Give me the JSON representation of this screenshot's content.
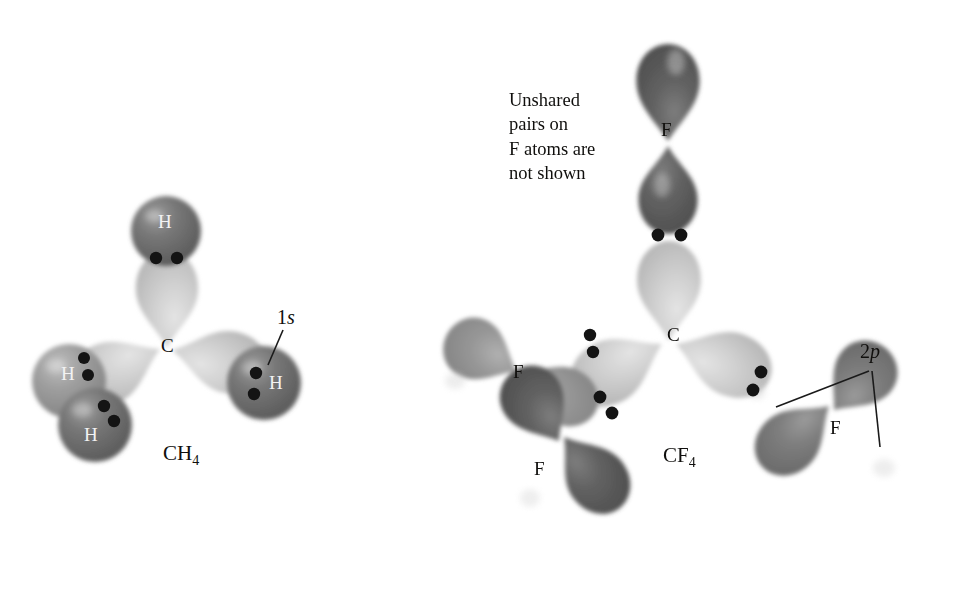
{
  "figure": {
    "background": "#ffffff",
    "width": 972,
    "height": 606
  },
  "annotation": {
    "note_text": "Unshared\npairs on\nF atoms are\nnot shown"
  },
  "colors": {
    "carbon_lobe": "#c9c9c9",
    "carbon_lobe_edge": "#b0b0b0",
    "hydrogen_sphere_front": "#6e6e6e",
    "hydrogen_sphere_back": "#9a9a9a",
    "fluorine_lobe_dark": "#5d5d5d",
    "fluorine_lobe_mid": "#7c7c7c",
    "fluorine_lobe_light": "#949494",
    "electron_dot": "#141414",
    "text": "#100f0d",
    "text_on_orbital": "#f2f2f2",
    "leader_line": "#1a1a1a"
  },
  "molecules": [
    {
      "id": "ch4",
      "formula_main": "CH",
      "formula_sub": "4",
      "formula_label": "CH4",
      "center_atom": "C",
      "orbital_callout": {
        "prefix": "1",
        "italic": "s",
        "label": "1s",
        "description": "hydrogen 1s orbital"
      },
      "atoms": [
        {
          "symbol": "H",
          "position": "top",
          "label_color": "white"
        },
        {
          "symbol": "H",
          "position": "lower-left-back",
          "label_color": "white"
        },
        {
          "symbol": "H",
          "position": "lower-left-front",
          "label_color": "white"
        },
        {
          "symbol": "H",
          "position": "right",
          "label_color": "white"
        },
        {
          "symbol": "C",
          "position": "center",
          "label_color": "black"
        }
      ],
      "bond_pairs": 4,
      "electron_dots_per_bond": 2
    },
    {
      "id": "cf4",
      "formula_main": "CF",
      "formula_sub": "4",
      "formula_label": "CF4",
      "center_atom": "C",
      "orbital_callout": {
        "prefix": "2",
        "italic": "p",
        "label": "2p",
        "description": "fluorine 2p orbital",
        "leader_count": 2
      },
      "atoms": [
        {
          "symbol": "F",
          "position": "top",
          "label_color": "black"
        },
        {
          "symbol": "F",
          "position": "left",
          "label_color": "black"
        },
        {
          "symbol": "F",
          "position": "bottom-left",
          "label_color": "black"
        },
        {
          "symbol": "F",
          "position": "right",
          "label_color": "black"
        },
        {
          "symbol": "C",
          "position": "center",
          "label_color": "black"
        }
      ],
      "bond_pairs": 4,
      "electron_dots_per_bond": 2
    }
  ],
  "labels": {
    "ch4_C": "C",
    "ch4_H_top": "H",
    "ch4_H_left_back": "H",
    "ch4_H_left_front": "H",
    "ch4_H_right": "H",
    "ch4_orbital_prefix": "1",
    "ch4_orbital_italic": "s",
    "ch4_formula_main": "CH",
    "ch4_formula_sub": "4",
    "cf4_C": "C",
    "cf4_F_top": "F",
    "cf4_F_left": "F",
    "cf4_F_bottom": "F",
    "cf4_F_right": "F",
    "cf4_orbital_prefix": "2",
    "cf4_orbital_italic": "p",
    "cf4_formula_main": "CF",
    "cf4_formula_sub": "4"
  }
}
